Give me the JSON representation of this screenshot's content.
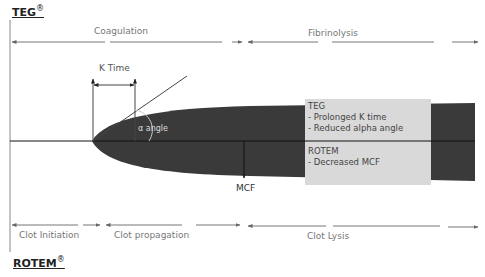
{
  "headers": {
    "teg": "TEG",
    "teg_mark": "®",
    "rotem": "ROTEM",
    "rotem_mark": "®"
  },
  "phases_top": {
    "coagulation": "Coagulation",
    "fibrinolysis": "Fibrinolysis"
  },
  "phases_bottom": {
    "clot_initiation": "Clot Initiation",
    "clot_propagation": "Clot propagation",
    "clot_lysis": "Clot Lysis"
  },
  "annotations": {
    "k_time": "K Time",
    "alpha_angle": "α angle",
    "mcf": "MCF"
  },
  "info_box": {
    "teg_title": "TEG",
    "teg_line1": "- Prolonged K time",
    "teg_line2": "- Reduced alpha angle",
    "rotem_title": "ROTEM",
    "rotem_line1": "- Decreased MCF"
  },
  "colors": {
    "shape": "#3a3a3a",
    "box": "#d9d9d9",
    "arrow": "#666666",
    "text_light": "#777777"
  }
}
